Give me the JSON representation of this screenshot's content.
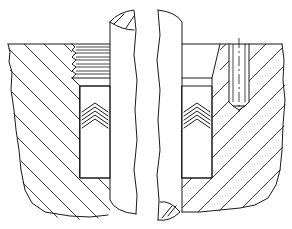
{
  "figure": {
    "type": "technical-cross-section",
    "colors": {
      "line": "#1a1a1a",
      "background": "#ffffff"
    },
    "components": [
      {
        "name": "housing-left",
        "hatching": "diagonal"
      },
      {
        "name": "housing-right",
        "hatching": "diagonal"
      },
      {
        "name": "threaded-gland-bore",
        "threads": 7
      },
      {
        "name": "shaft-left-half"
      },
      {
        "name": "shaft-right-half"
      },
      {
        "name": "chevron-packing-left",
        "rings": 5
      },
      {
        "name": "chevron-packing-right",
        "rings": 5
      },
      {
        "name": "tapped-hole",
        "side": "right"
      }
    ]
  }
}
